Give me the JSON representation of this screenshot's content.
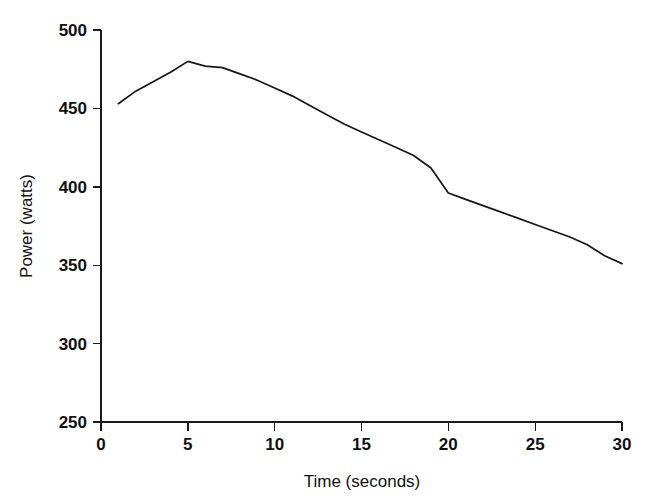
{
  "chart_data": {
    "type": "line",
    "title": "",
    "xlabel": "Time (seconds)",
    "ylabel": "Power (watts)",
    "xlim": [
      0,
      30
    ],
    "ylim": [
      250,
      500
    ],
    "xticks": [
      0,
      5,
      10,
      15,
      20,
      25,
      30
    ],
    "yticks": [
      250,
      300,
      350,
      400,
      450,
      500
    ],
    "xtick_labels": [
      "0",
      "5",
      "10",
      "15",
      "20",
      "25",
      "30"
    ],
    "ytick_labels": [
      "250",
      "300",
      "350",
      "400",
      "450",
      "500"
    ],
    "grid": false,
    "legend": null,
    "series": [
      {
        "name": "Power",
        "color": "#161616",
        "x": [
          1.0,
          2.0,
          3.0,
          4.0,
          5.0,
          6.0,
          7.0,
          8.0,
          9.0,
          10.0,
          11.0,
          12.0,
          13.0,
          14.0,
          15.0,
          16.0,
          17.0,
          18.0,
          19.0,
          20.0,
          21.0,
          22.0,
          23.0,
          24.0,
          25.0,
          26.0,
          27.0,
          28.0,
          29.0,
          30.0
        ],
        "y": [
          453,
          461,
          467,
          473,
          480,
          477,
          476,
          472,
          468,
          463,
          458,
          452,
          446,
          440,
          435,
          430,
          425,
          420,
          412,
          396,
          392,
          388,
          384,
          380,
          376,
          372,
          368,
          363,
          356,
          351
        ]
      }
    ]
  },
  "axes": {
    "ylabel": "Power (watts)",
    "xlabel": "Time (seconds)"
  }
}
